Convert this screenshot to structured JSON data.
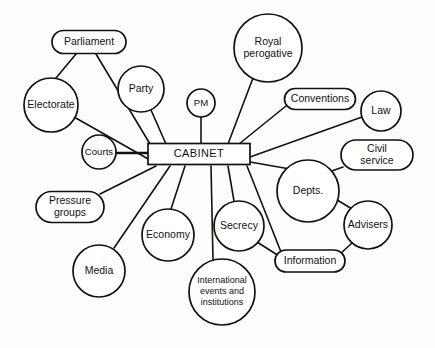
{
  "diagram": {
    "type": "spider-diagram",
    "center": {
      "id": "cabinet",
      "label": "CABINET",
      "shape": "rectangle",
      "x": 199,
      "y": 154,
      "w": 102,
      "h": 21
    },
    "nodes": [
      {
        "id": "parliament",
        "label": "Parliament",
        "shape": "rounded-rect",
        "x": 89,
        "y": 42,
        "w": 74,
        "h": 23,
        "lines": [
          "Parliament"
        ]
      },
      {
        "id": "electorate",
        "label": "Electorate",
        "shape": "circle",
        "x": 51,
        "y": 105,
        "r": 27,
        "lines": [
          "Electorate"
        ]
      },
      {
        "id": "party",
        "label": "Party",
        "shape": "circle",
        "x": 141,
        "y": 89,
        "r": 23,
        "lines": [
          "Party"
        ]
      },
      {
        "id": "pm",
        "label": "PM",
        "shape": "circle",
        "x": 201,
        "y": 103,
        "r": 14,
        "lines": [
          "PM"
        ]
      },
      {
        "id": "royal-perogative",
        "label": "Royal perogative",
        "shape": "circle",
        "x": 268,
        "y": 48,
        "r": 34,
        "lines": [
          "Royal",
          "perogative"
        ]
      },
      {
        "id": "conventions",
        "label": "Conventions",
        "shape": "rounded-rect",
        "x": 320,
        "y": 99,
        "w": 71,
        "h": 21,
        "lines": [
          "Conventions"
        ]
      },
      {
        "id": "law",
        "label": "Law",
        "shape": "circle",
        "x": 381,
        "y": 111,
        "r": 20,
        "lines": [
          "Law"
        ]
      },
      {
        "id": "civil-service",
        "label": "Civil service",
        "shape": "rounded-rect",
        "x": 377,
        "y": 155,
        "w": 72,
        "h": 30,
        "lines": [
          "Civil",
          "service"
        ]
      },
      {
        "id": "courts",
        "label": "Courts",
        "shape": "circle",
        "x": 99,
        "y": 152,
        "r": 17,
        "lines": [
          "Courts"
        ]
      },
      {
        "id": "depts",
        "label": "Depts.",
        "shape": "circle",
        "x": 308,
        "y": 191,
        "r": 31,
        "lines": [
          "Depts."
        ]
      },
      {
        "id": "advisers",
        "label": "Advisers",
        "shape": "circle",
        "x": 368,
        "y": 225,
        "r": 24,
        "lines": [
          "Advisers"
        ]
      },
      {
        "id": "pressure-groups",
        "label": "Pressure groups",
        "shape": "rounded-rect",
        "x": 70,
        "y": 207,
        "w": 68,
        "h": 31,
        "lines": [
          "Pressure",
          "groups"
        ]
      },
      {
        "id": "media",
        "label": "Media",
        "shape": "circle",
        "x": 99,
        "y": 271,
        "r": 26,
        "lines": [
          "Media"
        ]
      },
      {
        "id": "economy",
        "label": "Economy",
        "shape": "circle",
        "x": 168,
        "y": 235,
        "r": 26,
        "lines": [
          "Economy"
        ]
      },
      {
        "id": "secrecy",
        "label": "Secrecy",
        "shape": "circle",
        "x": 239,
        "y": 226,
        "r": 25,
        "lines": [
          "Secrecy"
        ]
      },
      {
        "id": "information",
        "label": "Information",
        "shape": "rounded-rect",
        "x": 310,
        "y": 261,
        "w": 70,
        "h": 22,
        "lines": [
          "Information"
        ]
      },
      {
        "id": "international-events",
        "label": "International events and institutions",
        "shape": "circle",
        "x": 222,
        "y": 292,
        "r": 33,
        "lines": [
          "International",
          "events and",
          "institutions"
        ]
      }
    ],
    "edges": [
      {
        "from": "parliament",
        "to": "electorate",
        "x1": 76,
        "y1": 54,
        "x2": 56,
        "y2": 78
      },
      {
        "from": "parliament",
        "to": "cabinet",
        "x1": 96,
        "y1": 54,
        "x2": 150,
        "y2": 144
      },
      {
        "from": "electorate",
        "to": "cabinet",
        "x1": 74,
        "y1": 117,
        "x2": 150,
        "y2": 160
      },
      {
        "from": "party",
        "to": "cabinet",
        "x1": 151,
        "y1": 110,
        "x2": 166,
        "y2": 144
      },
      {
        "from": "pm",
        "to": "cabinet",
        "x1": 201,
        "y1": 117,
        "x2": 201,
        "y2": 144
      },
      {
        "from": "royal-perogative",
        "to": "cabinet",
        "x1": 253,
        "y1": 78,
        "x2": 228,
        "y2": 144
      },
      {
        "from": "conventions",
        "to": "cabinet",
        "x1": 286,
        "y1": 106,
        "x2": 239,
        "y2": 144
      },
      {
        "from": "law",
        "to": "cabinet",
        "x1": 362,
        "y1": 117,
        "x2": 250,
        "y2": 157
      },
      {
        "from": "courts",
        "to": "cabinet",
        "x1": 116,
        "y1": 153,
        "x2": 148,
        "y2": 153
      },
      {
        "from": "civil-service",
        "to": "depts",
        "x1": 343,
        "y1": 167,
        "x2": 329,
        "y2": 172
      },
      {
        "from": "depts",
        "to": "cabinet",
        "x1": 290,
        "y1": 169,
        "x2": 250,
        "y2": 162
      },
      {
        "from": "advisers",
        "to": "depts",
        "x1": 352,
        "y1": 209,
        "x2": 334,
        "y2": 198
      },
      {
        "from": "advisers",
        "to": "information",
        "x1": 352,
        "y1": 243,
        "x2": 340,
        "y2": 254
      },
      {
        "from": "information",
        "to": "cabinet",
        "x1": 281,
        "y1": 252,
        "x2": 247,
        "y2": 166
      },
      {
        "from": "secrecy",
        "to": "information",
        "x1": 257,
        "y1": 242,
        "x2": 279,
        "y2": 256
      },
      {
        "from": "secrecy",
        "to": "cabinet",
        "x1": 234,
        "y1": 201,
        "x2": 228,
        "y2": 166
      },
      {
        "from": "economy",
        "to": "cabinet",
        "x1": 171,
        "y1": 209,
        "x2": 185,
        "y2": 166
      },
      {
        "from": "international-events",
        "to": "cabinet",
        "x1": 213,
        "y1": 260,
        "x2": 211,
        "y2": 166
      },
      {
        "from": "media",
        "to": "cabinet",
        "x1": 114,
        "y1": 248,
        "x2": 170,
        "y2": 166
      },
      {
        "from": "pressure-groups",
        "to": "cabinet",
        "x1": 100,
        "y1": 194,
        "x2": 156,
        "y2": 166
      }
    ]
  }
}
